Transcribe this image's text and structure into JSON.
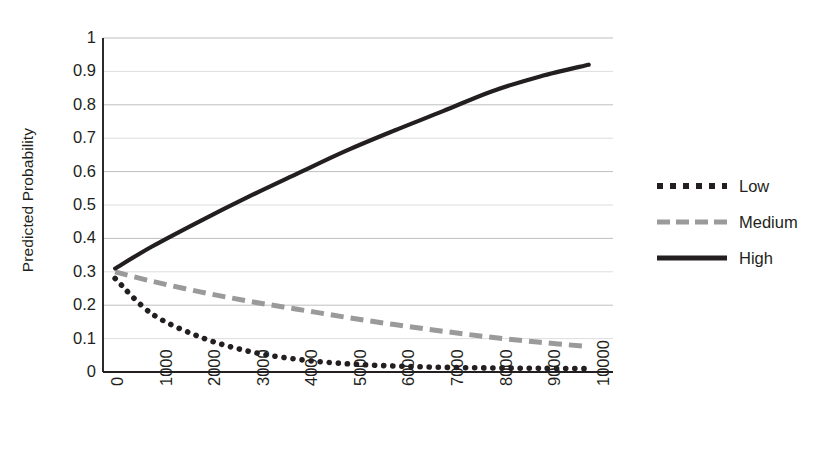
{
  "chart_data": {
    "type": "line",
    "title": "",
    "xlabel": "",
    "ylabel": "Predicted Probability",
    "xlim": [
      0,
      10500
    ],
    "ylim": [
      0,
      1
    ],
    "grid": true,
    "legend_position": "right",
    "ytick_labels": [
      "1",
      "0.9",
      "0.8",
      "0.7",
      "0.6",
      "0.5",
      "0.4",
      "0.3",
      "0.2",
      "0.1",
      "0"
    ],
    "ytick_values": [
      1,
      0.9,
      0.8,
      0.7,
      0.6,
      0.5,
      0.4,
      0.3,
      0.2,
      0.1,
      0
    ],
    "xtick_labels": [
      "0",
      "1000",
      "2000",
      "3000",
      "4000",
      "5000",
      "6000",
      "7000",
      "8000",
      "9000",
      "10000"
    ],
    "xtick_values": [
      0,
      1000,
      2000,
      3000,
      4000,
      5000,
      6000,
      7000,
      8000,
      9000,
      10000
    ],
    "x": [
      250,
      1000,
      2000,
      3000,
      4000,
      5000,
      6000,
      7000,
      8000,
      9000,
      10000
    ],
    "series": [
      {
        "name": "Low",
        "style": "dotted",
        "color": "#231f20",
        "values": [
          0.28,
          0.175,
          0.105,
          0.062,
          0.038,
          0.025,
          0.018,
          0.014,
          0.012,
          0.011,
          0.01
        ]
      },
      {
        "name": "Medium",
        "style": "dashed",
        "color": "#9a9a9a",
        "values": [
          0.3,
          0.272,
          0.24,
          0.212,
          0.188,
          0.164,
          0.142,
          0.122,
          0.104,
          0.089,
          0.076
        ]
      },
      {
        "name": "High",
        "style": "solid",
        "color": "#231f20",
        "values": [
          0.31,
          0.375,
          0.452,
          0.525,
          0.594,
          0.662,
          0.723,
          0.781,
          0.84,
          0.885,
          0.92
        ]
      }
    ]
  },
  "legend": {
    "items": [
      {
        "label": "Low"
      },
      {
        "label": "Medium"
      },
      {
        "label": "High"
      }
    ]
  },
  "axes": {
    "ylabel_title": "Predicted Probability"
  },
  "colors": {
    "axis": "#231f20",
    "grid_major": "#bfbfbf",
    "grid_minor": "#d9d9d9",
    "low": "#231f20",
    "medium": "#9a9a9a",
    "high": "#231f20",
    "background": "#ffffff"
  }
}
